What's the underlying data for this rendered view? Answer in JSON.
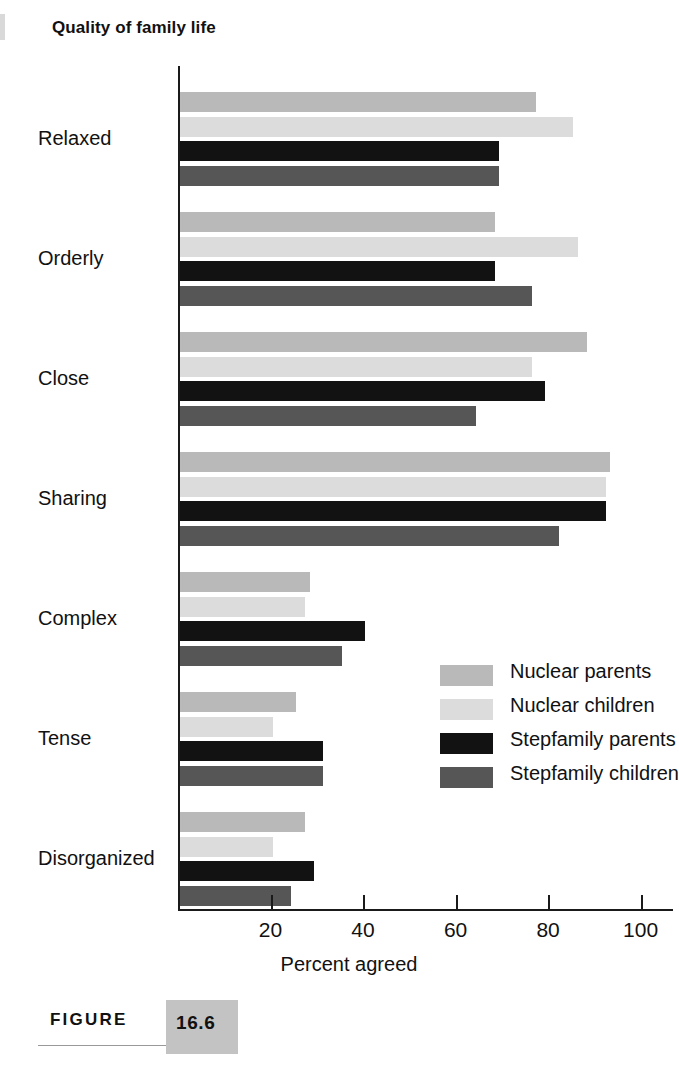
{
  "title": "Quality of family life",
  "figure": {
    "word": "FIGURE",
    "number": "16.6"
  },
  "axis": {
    "x_title": "Percent agreed",
    "x_ticks": [
      "20",
      "40",
      "60",
      "80",
      "100"
    ]
  },
  "legend": {
    "items": [
      {
        "label": "Nuclear parents",
        "color": "#b9b9b9"
      },
      {
        "label": "Nuclear children",
        "color": "#dcdcdc"
      },
      {
        "label": "Stepfamily parents",
        "color": "#121212"
      },
      {
        "label": "Stepfamily children",
        "color": "#565656"
      }
    ]
  },
  "chart_data": {
    "type": "bar",
    "orientation": "horizontal",
    "title": "Quality of family life",
    "xlabel": "Percent agreed",
    "ylabel": "",
    "xlim": [
      0,
      107
    ],
    "xticks": [
      20,
      40,
      60,
      80,
      100
    ],
    "grid": false,
    "legend_position": "inside-right",
    "categories": [
      "Relaxed",
      "Orderly",
      "Close",
      "Sharing",
      "Complex",
      "Tense",
      "Disorganized"
    ],
    "series": [
      {
        "name": "Nuclear parents",
        "color": "#b9b9b9",
        "values": [
          77,
          68,
          88,
          93,
          28,
          25,
          27
        ]
      },
      {
        "name": "Nuclear children",
        "color": "#dcdcdc",
        "values": [
          85,
          86,
          76,
          92,
          27,
          20,
          20
        ]
      },
      {
        "name": "Stepfamily parents",
        "color": "#121212",
        "values": [
          69,
          68,
          79,
          92,
          40,
          31,
          29
        ]
      },
      {
        "name": "Stepfamily children",
        "color": "#565656",
        "values": [
          69,
          76,
          64,
          82,
          35,
          31,
          24
        ]
      }
    ]
  }
}
